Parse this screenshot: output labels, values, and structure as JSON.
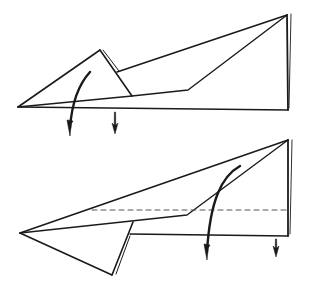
{
  "diagram": {
    "title": "",
    "type": "origami folding steps",
    "colors": {
      "line": "#1a1a1a",
      "dashed": "#555555",
      "background": "#ffffff"
    },
    "steps": [
      {
        "id": "step-1",
        "description": "Paper airplane side view with small triangular flap; fold flap down",
        "polylines": [
          {
            "name": "bottom-edge",
            "points": "18,107 288,110",
            "w": 1.6
          },
          {
            "name": "right-edge",
            "points": "287,15 288,110",
            "w": 1.8
          },
          {
            "name": "right-edge-double",
            "points": "291,14 289,108",
            "w": 0.9
          },
          {
            "name": "top-edge",
            "points": "117,72 287,15",
            "w": 1.6
          },
          {
            "name": "inner-edge",
            "points": "18,107 132,96 188,90 287,15",
            "w": 1.4
          },
          {
            "name": "flap-left-edge",
            "points": "18,107 100,50",
            "w": 1.6
          },
          {
            "name": "flap-right-edge",
            "points": "100,50 132,96",
            "w": 1.6
          },
          {
            "name": "flap-double-edge",
            "points": "103,50 119,71",
            "w": 1.0
          }
        ],
        "dashed": [],
        "arrows": [
          {
            "name": "curved-fold-arrow",
            "kind": "curved",
            "path": "M90,72 C79,84 72,100 70,128",
            "tip": "70,132"
          },
          {
            "name": "straight-down-arrow",
            "kind": "straight",
            "x": 115,
            "y1": 112,
            "y2": 134
          }
        ]
      },
      {
        "id": "step-2",
        "description": "Flap folded down; fold along dashed line (valley fold) behind",
        "polylines": [
          {
            "name": "top-edge",
            "points": "20,233 288,140",
            "w": 1.6
          },
          {
            "name": "inner-edge",
            "points": "20,233 187,215 288,140",
            "w": 1.4
          },
          {
            "name": "right-edge",
            "points": "288,140 288,236",
            "w": 1.8
          },
          {
            "name": "right-edge-double",
            "points": "292,140 290,234",
            "w": 0.9
          },
          {
            "name": "bottom-edge",
            "points": "130,234 288,236",
            "w": 1.6
          },
          {
            "name": "flap-lower-edge",
            "points": "20,233 112,275",
            "w": 1.6
          },
          {
            "name": "flap-right-edge",
            "points": "112,275 133,222",
            "w": 1.6
          },
          {
            "name": "flap-double-edge",
            "points": "116,274 130,236",
            "w": 1.0
          }
        ],
        "dashed": [
          {
            "name": "valley-fold-line",
            "points": "92,210 288,210"
          }
        ],
        "arrows": [
          {
            "name": "curved-fold-arrow",
            "kind": "curved",
            "path": "M240,166 C222,176 210,200 207,252",
            "tip": "207,256"
          },
          {
            "name": "straight-down-arrow",
            "kind": "straight",
            "x": 276,
            "y1": 239,
            "y2": 257
          }
        ]
      }
    ]
  }
}
